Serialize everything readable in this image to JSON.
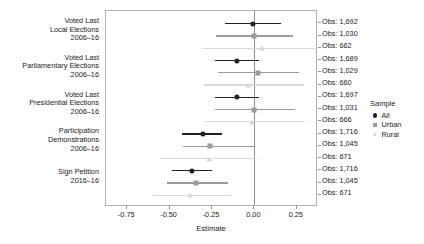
{
  "chart_data": {
    "type": "scatter",
    "title": "",
    "xlabel": "Estimate",
    "ylabel": "",
    "xlim": [
      -0.875,
      0.375
    ],
    "xticks": [
      -0.75,
      -0.5,
      -0.25,
      0.0,
      0.25
    ],
    "xticklabels": [
      "-0.75",
      "-0.50",
      "-0.25",
      "0.00",
      "0.25"
    ],
    "grid": false,
    "reference_line": 0.0,
    "legend": {
      "title": "Sample",
      "position": "right",
      "entries": [
        {
          "name": "All",
          "marker": "circle",
          "color": "#222222"
        },
        {
          "name": "Urban",
          "marker": "square",
          "color": "#9a9a9a"
        },
        {
          "name": "Rural",
          "marker": "triangle",
          "color": "#d8d8d8"
        }
      ]
    },
    "categories": [
      "Voted Last\nLocal Elections\n2006–16",
      "Voted Last\nParliamentary Elections\n2006–16",
      "Voted Last\nPresidential Elections\n2006–16",
      "Participation\nDemonstrations\n2006–16",
      "Sign Petition\n2016–16"
    ],
    "points": [
      {
        "category": 0,
        "series": "All",
        "estimate": -0.01,
        "ci_low": -0.175,
        "ci_high": 0.155,
        "obs_label": "Obs: 1,692"
      },
      {
        "category": 0,
        "series": "Urban",
        "estimate": 0.0,
        "ci_low": -0.225,
        "ci_high": 0.225,
        "obs_label": "Obs: 1,030"
      },
      {
        "category": 0,
        "series": "Rural",
        "estimate": 0.045,
        "ci_low": -0.31,
        "ci_high": 0.375,
        "obs_label": "Obs: 662"
      },
      {
        "category": 1,
        "series": "All",
        "estimate": -0.105,
        "ci_low": -0.235,
        "ci_high": 0.03,
        "obs_label": "Obs: 1,689"
      },
      {
        "category": 1,
        "series": "Urban",
        "estimate": 0.02,
        "ci_low": -0.215,
        "ci_high": 0.265,
        "obs_label": "Obs: 1,029"
      },
      {
        "category": 1,
        "series": "Rural",
        "estimate": -0.035,
        "ci_low": -0.295,
        "ci_high": 0.295,
        "obs_label": "Obs: 660"
      },
      {
        "category": 2,
        "series": "All",
        "estimate": -0.105,
        "ci_low": -0.235,
        "ci_high": 0.03,
        "obs_label": "Obs: 1,697"
      },
      {
        "category": 2,
        "series": "Urban",
        "estimate": 0.0,
        "ci_low": -0.235,
        "ci_high": 0.24,
        "obs_label": "Obs: 1,031"
      },
      {
        "category": 2,
        "series": "Rural",
        "estimate": -0.015,
        "ci_low": -0.3,
        "ci_high": 0.3,
        "obs_label": "Obs: 666"
      },
      {
        "category": 3,
        "series": "All",
        "estimate": -0.305,
        "ci_low": -0.425,
        "ci_high": -0.19,
        "obs_label": "Obs: 1,716"
      },
      {
        "category": 3,
        "series": "Urban",
        "estimate": -0.26,
        "ci_low": -0.42,
        "ci_high": -0.005,
        "obs_label": "Obs: 1,045"
      },
      {
        "category": 3,
        "series": "Rural",
        "estimate": -0.265,
        "ci_low": -0.555,
        "ci_high": 0.015,
        "obs_label": "Obs: 671"
      },
      {
        "category": 4,
        "series": "All",
        "estimate": -0.37,
        "ci_low": -0.485,
        "ci_high": -0.25,
        "obs_label": "Obs: 1,716"
      },
      {
        "category": 4,
        "series": "Urban",
        "estimate": -0.345,
        "ci_low": -0.515,
        "ci_high": -0.155,
        "obs_label": "Obs: 1,045"
      },
      {
        "category": 4,
        "series": "Rural",
        "estimate": -0.38,
        "ci_low": -0.6,
        "ci_high": -0.14,
        "obs_label": "Obs: 671"
      }
    ]
  }
}
